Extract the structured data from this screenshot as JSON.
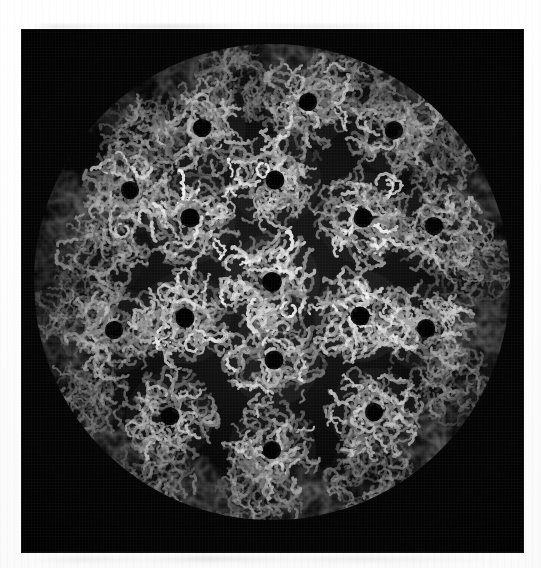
{
  "figure": {
    "domain": "scientific-illustration",
    "subject": "icosahedral virus capsid",
    "render_style": "grayscale C-alpha backbone trace",
    "background_color": "#050505",
    "page_color": "#ffffff",
    "structure_color_bright": "#e8e8e8",
    "structure_color_mid": "#9a9a9a",
    "structure_color_dim": "#4a4a4a",
    "alt_text": "Grayscale molecular model of an icosahedral virus capsid viewed down a five-fold axis, composed of ring-shaped pentameric capsomers rendered as protein backbone traces on a black background.",
    "caption": ""
  },
  "panel": {
    "x": 22,
    "y": 30,
    "width": 501,
    "height": 522
  },
  "chart_data": {
    "type": "scatter",
    "title": "Icosahedral virus capsid, T=7 lattice",
    "xlabel": "",
    "ylabel": "",
    "grid": false,
    "legend": "none",
    "sphere": {
      "cx": 250,
      "cy": 252,
      "radius": 236
    },
    "capsomer_count": 60,
    "capsomers": [
      {
        "x": 250,
        "y": 252,
        "r": 52,
        "b": 1.0,
        "ring": true
      },
      {
        "x": 168,
        "y": 188,
        "r": 50,
        "b": 0.96,
        "ring": true
      },
      {
        "x": 253,
        "y": 150,
        "r": 50,
        "b": 0.94,
        "ring": true
      },
      {
        "x": 341,
        "y": 188,
        "r": 50,
        "b": 0.95,
        "ring": true
      },
      {
        "x": 338,
        "y": 286,
        "r": 50,
        "b": 0.97,
        "ring": true
      },
      {
        "x": 252,
        "y": 330,
        "r": 50,
        "b": 0.96,
        "ring": true
      },
      {
        "x": 163,
        "y": 288,
        "r": 50,
        "b": 0.95,
        "ring": true
      },
      {
        "x": 108,
        "y": 160,
        "r": 48,
        "b": 0.82,
        "ring": true
      },
      {
        "x": 180,
        "y": 98,
        "r": 48,
        "b": 0.8,
        "ring": true
      },
      {
        "x": 286,
        "y": 72,
        "r": 48,
        "b": 0.84,
        "ring": true
      },
      {
        "x": 372,
        "y": 100,
        "r": 48,
        "b": 0.78,
        "ring": true
      },
      {
        "x": 412,
        "y": 196,
        "r": 48,
        "b": 0.8,
        "ring": true
      },
      {
        "x": 404,
        "y": 298,
        "r": 48,
        "b": 0.83,
        "ring": true
      },
      {
        "x": 352,
        "y": 382,
        "r": 48,
        "b": 0.86,
        "ring": true
      },
      {
        "x": 250,
        "y": 420,
        "r": 48,
        "b": 0.84,
        "ring": true
      },
      {
        "x": 148,
        "y": 386,
        "r": 48,
        "b": 0.83,
        "ring": true
      },
      {
        "x": 92,
        "y": 300,
        "r": 48,
        "b": 0.78,
        "ring": true
      },
      {
        "x": 80,
        "y": 226,
        "r": 46,
        "b": 0.68,
        "ring": false
      },
      {
        "x": 122,
        "y": 108,
        "r": 44,
        "b": 0.62,
        "ring": false
      },
      {
        "x": 218,
        "y": 48,
        "r": 44,
        "b": 0.6,
        "ring": false
      },
      {
        "x": 330,
        "y": 48,
        "r": 44,
        "b": 0.62,
        "ring": false
      },
      {
        "x": 420,
        "y": 118,
        "r": 44,
        "b": 0.58,
        "ring": false
      },
      {
        "x": 448,
        "y": 232,
        "r": 44,
        "b": 0.6,
        "ring": false
      },
      {
        "x": 430,
        "y": 350,
        "r": 44,
        "b": 0.62,
        "ring": false
      },
      {
        "x": 348,
        "y": 446,
        "r": 44,
        "b": 0.64,
        "ring": false
      },
      {
        "x": 236,
        "y": 474,
        "r": 44,
        "b": 0.66,
        "ring": false
      },
      {
        "x": 130,
        "y": 452,
        "r": 44,
        "b": 0.62,
        "ring": false
      },
      {
        "x": 62,
        "y": 368,
        "r": 44,
        "b": 0.58,
        "ring": false
      },
      {
        "x": 54,
        "y": 284,
        "r": 42,
        "b": 0.55,
        "ring": false
      },
      {
        "x": 62,
        "y": 180,
        "r": 40,
        "b": 0.45,
        "ring": false
      },
      {
        "x": 166,
        "y": 42,
        "r": 40,
        "b": 0.42,
        "ring": false
      },
      {
        "x": 276,
        "y": 30,
        "r": 40,
        "b": 0.4,
        "ring": false
      },
      {
        "x": 392,
        "y": 62,
        "r": 40,
        "b": 0.42,
        "ring": false
      },
      {
        "x": 458,
        "y": 168,
        "r": 40,
        "b": 0.4,
        "ring": false
      },
      {
        "x": 462,
        "y": 296,
        "r": 40,
        "b": 0.44,
        "ring": false
      },
      {
        "x": 404,
        "y": 410,
        "r": 40,
        "b": 0.46,
        "ring": false
      },
      {
        "x": 292,
        "y": 476,
        "r": 40,
        "b": 0.46,
        "ring": false
      },
      {
        "x": 178,
        "y": 468,
        "r": 40,
        "b": 0.44,
        "ring": false
      },
      {
        "x": 84,
        "y": 420,
        "r": 40,
        "b": 0.4,
        "ring": false
      },
      {
        "x": 36,
        "y": 320,
        "r": 38,
        "b": 0.36,
        "ring": false
      },
      {
        "x": 34,
        "y": 222,
        "r": 36,
        "b": 0.32,
        "ring": false
      },
      {
        "x": 92,
        "y": 72,
        "r": 36,
        "b": 0.3,
        "ring": false
      },
      {
        "x": 206,
        "y": 16,
        "r": 34,
        "b": 0.26,
        "ring": false
      },
      {
        "x": 350,
        "y": 20,
        "r": 34,
        "b": 0.26,
        "ring": false
      },
      {
        "x": 452,
        "y": 98,
        "r": 34,
        "b": 0.28,
        "ring": false
      },
      {
        "x": 484,
        "y": 238,
        "r": 32,
        "b": 0.26,
        "ring": false
      },
      {
        "x": 460,
        "y": 378,
        "r": 34,
        "b": 0.28,
        "ring": false
      },
      {
        "x": 352,
        "y": 486,
        "r": 34,
        "b": 0.3,
        "ring": false
      },
      {
        "x": 208,
        "y": 500,
        "r": 34,
        "b": 0.28,
        "ring": false
      },
      {
        "x": 92,
        "y": 472,
        "r": 34,
        "b": 0.26,
        "ring": false
      },
      {
        "x": 20,
        "y": 272,
        "r": 30,
        "b": 0.2,
        "ring": false
      },
      {
        "x": 112,
        "y": 508,
        "r": 28,
        "b": 0.18,
        "ring": false
      },
      {
        "x": 270,
        "y": 508,
        "r": 30,
        "b": 0.22,
        "ring": false
      },
      {
        "x": 406,
        "y": 462,
        "r": 30,
        "b": 0.2,
        "ring": false
      },
      {
        "x": 490,
        "y": 330,
        "r": 28,
        "b": 0.18,
        "ring": false
      },
      {
        "x": 488,
        "y": 170,
        "r": 28,
        "b": 0.18,
        "ring": false
      },
      {
        "x": 402,
        "y": 40,
        "r": 28,
        "b": 0.18,
        "ring": false
      },
      {
        "x": 258,
        "y": 8,
        "r": 26,
        "b": 0.14,
        "ring": false
      },
      {
        "x": 120,
        "y": 34,
        "r": 26,
        "b": 0.14,
        "ring": false
      },
      {
        "x": 28,
        "y": 148,
        "r": 26,
        "b": 0.14,
        "ring": false
      }
    ]
  }
}
